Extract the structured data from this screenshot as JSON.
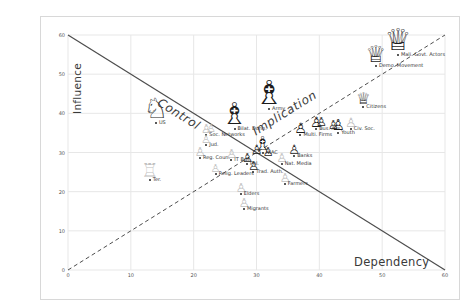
{
  "chart_data": {
    "type": "scatter",
    "title": "",
    "xlabel": "Dependency",
    "ylabel": "Influence",
    "xlim": [
      0,
      60
    ],
    "ylim": [
      0,
      60
    ],
    "x_ticks": [
      0,
      10,
      20,
      30,
      40,
      50,
      60
    ],
    "y_ticks": [
      0,
      10,
      20,
      30,
      40,
      50,
      60
    ],
    "grid": true,
    "legend": "none",
    "diagonals": {
      "solid_line": {
        "from_xy": [
          0,
          60
        ],
        "to_xy": [
          60,
          0
        ],
        "style": "solid"
      },
      "dashed_line": {
        "from_xy": [
          0,
          0
        ],
        "to_xy": [
          60,
          60
        ],
        "style": "dashed"
      }
    },
    "quadrant_labels": [
      {
        "text": "Control",
        "x": 17.5,
        "y": 41,
        "rotation_deg": 32
      },
      {
        "text": "Implication",
        "x": 34.5,
        "y": 40,
        "rotation_deg": -32
      }
    ],
    "icons": {
      "knight": "♘",
      "bishop": "♗",
      "queen": "♕",
      "rook": "♖",
      "pawn": "♙"
    },
    "colors": {
      "grid": "#e7e7e7",
      "diagonal": "#4d4d4d",
      "piece_dark": "#1c1c1c",
      "piece_light": "#c0c0c0",
      "dot": "#222222",
      "text": "#333333"
    },
    "points": [
      {
        "label": "US",
        "x": 14,
        "y": 37.5,
        "piece": "knight",
        "size": 28,
        "shade": "dark"
      },
      {
        "label": "Bilat. Donn.",
        "x": 26.5,
        "y": 36,
        "piece": "bishop",
        "size": 30,
        "shade": "dark"
      },
      {
        "label": "Army",
        "x": 32,
        "y": 41,
        "piece": "bishop",
        "size": 33,
        "shade": "dark"
      },
      {
        "label": "Mali. Govt. Actors",
        "x": 52.5,
        "y": 55,
        "piece": "queen",
        "size": 30,
        "shade": "dark"
      },
      {
        "label": "Demo. Movement",
        "x": 49,
        "y": 52,
        "piece": "queen",
        "size": 23,
        "shade": "dark"
      },
      {
        "label": "Citizens",
        "x": 47,
        "y": 41.5,
        "piece": "queen",
        "size": 16,
        "shade": "dark"
      },
      {
        "label": "Soc. Networks",
        "x": 22,
        "y": 34.5,
        "piece": "pawn",
        "size": 12,
        "shade": "light"
      },
      {
        "label": "",
        "x": 22.8,
        "y": 34.8,
        "piece": "pawn",
        "size": 11,
        "shade": "light"
      },
      {
        "label": "Jud.",
        "x": 22,
        "y": 32,
        "piece": "pawn",
        "size": 11,
        "shade": "light"
      },
      {
        "label": "Reg. Coun.",
        "x": 21,
        "y": 28.5,
        "piece": "pawn",
        "size": 12,
        "shade": "light"
      },
      {
        "label": "IT Bus.",
        "x": 26,
        "y": 28,
        "piece": "pawn",
        "size": 12,
        "shade": "light"
      },
      {
        "label": "NIAC",
        "x": 31,
        "y": 30,
        "piece": "bishop",
        "size": 19,
        "shade": "dark"
      },
      {
        "label": "",
        "x": 30,
        "y": 29,
        "piece": "pawn",
        "size": 13,
        "shade": "dark"
      },
      {
        "label": "",
        "x": 31.8,
        "y": 28.6,
        "piece": "pawn",
        "size": 12,
        "shade": "dark"
      },
      {
        "label": "Pol.",
        "x": 28.5,
        "y": 27,
        "piece": "pawn",
        "size": 12,
        "shade": "dark"
      },
      {
        "label": "Trad. Auth.",
        "x": 29.5,
        "y": 25,
        "piece": "pawn",
        "size": 12,
        "shade": "dark"
      },
      {
        "label": "Relig. Leaders",
        "x": 23.5,
        "y": 24.5,
        "piece": "pawn",
        "size": 11,
        "shade": "light"
      },
      {
        "label": "Nat. Media",
        "x": 34,
        "y": 27,
        "piece": "pawn",
        "size": 12,
        "shade": "light"
      },
      {
        "label": "Banks",
        "x": 36,
        "y": 29,
        "piece": "pawn",
        "size": 13,
        "shade": "dark"
      },
      {
        "label": "Multi. Firms",
        "x": 37,
        "y": 34.5,
        "piece": "pawn",
        "size": 14,
        "shade": "dark"
      },
      {
        "label": "Bus. Ass.",
        "x": 39.5,
        "y": 36,
        "piece": "pawn",
        "size": 14,
        "shade": "dark"
      },
      {
        "label": "",
        "x": 40.3,
        "y": 36.3,
        "piece": "pawn",
        "size": 12,
        "shade": "dark"
      },
      {
        "label": "Youth",
        "x": 43,
        "y": 35,
        "piece": "pawn",
        "size": 15,
        "shade": "dark"
      },
      {
        "label": "",
        "x": 42.2,
        "y": 35.4,
        "piece": "pawn",
        "size": 12,
        "shade": "dark"
      },
      {
        "label": "Civ. Soc.",
        "x": 45,
        "y": 36,
        "piece": "pawn",
        "size": 13,
        "shade": "light"
      },
      {
        "label": "Farmers",
        "x": 34.5,
        "y": 22,
        "piece": "pawn",
        "size": 12,
        "shade": "light"
      },
      {
        "label": "Elders",
        "x": 27.5,
        "y": 19.5,
        "piece": "pawn",
        "size": 12,
        "shade": "light"
      },
      {
        "label": "Migrants",
        "x": 28,
        "y": 15.5,
        "piece": "pawn",
        "size": 12,
        "shade": "light"
      },
      {
        "label": "Ter.",
        "x": 13,
        "y": 23,
        "piece": "rook",
        "size": 19,
        "shade": "light"
      }
    ]
  }
}
